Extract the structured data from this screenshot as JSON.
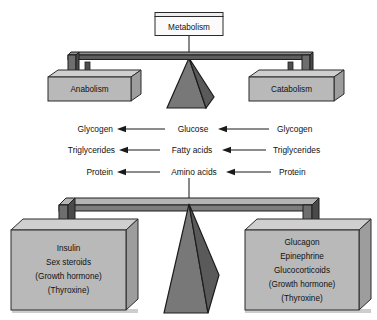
{
  "diagram": {
    "top_scale": {
      "pivot_label": "Metabolism",
      "left_pan_label": "Anabolism",
      "right_pan_label": "Catabolism"
    },
    "flows": [
      {
        "left_label": "Glycogen",
        "center_label": "Glucose",
        "right_label": "Glycogen",
        "left_arrow_direction": "left",
        "right_arrow_direction": "left"
      },
      {
        "left_label": "Triglycerides",
        "center_label": "Fatty acids",
        "right_label": "Triglycerides",
        "left_arrow_direction": "left",
        "right_arrow_direction": "left"
      },
      {
        "left_label": "Protein",
        "center_label": "Amino acids",
        "right_label": "Protein",
        "left_arrow_direction": "left",
        "right_arrow_direction": "left"
      }
    ],
    "bottom_scale": {
      "left_pan_lines": [
        "Insulin",
        "Sex steroids",
        "(Growth hormone)",
        "(Thyroxine)"
      ],
      "right_pan_lines": [
        "Glucagon",
        "Epinephrine",
        "Glucocorticoids",
        "(Growth hormone)",
        "(Thyroxine)"
      ]
    },
    "colors": {
      "background": "#ffffff",
      "box_face": "#b9b9b9",
      "box_top": "#cfcfcf",
      "box_side": "#9d9d9d",
      "metabolism_face": "#fbfbfb",
      "beam_dark": "#5d5d5d",
      "pyramid_left": "#787878",
      "pyramid_right": "#5a5a5a",
      "text": "#111111"
    }
  }
}
